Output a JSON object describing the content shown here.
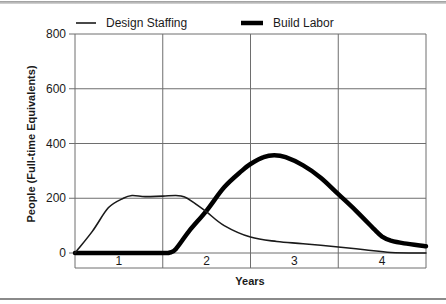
{
  "chart_data": {
    "type": "line",
    "title": "",
    "xlabel": "Years",
    "ylabel": "People (Full-time Equivalents)",
    "xlim": [
      0,
      4
    ],
    "ylim": [
      0,
      800
    ],
    "yticks": [
      0,
      200,
      400,
      600,
      800
    ],
    "ytick_labels": [
      "0",
      "200",
      "400",
      "600",
      "800"
    ],
    "x_band_labels": [
      "1",
      "2",
      "3",
      "4"
    ],
    "grid": true,
    "legend_position": "top",
    "series": [
      {
        "name": "Design Staffing",
        "style": "thin",
        "color": "#1a1a1a",
        "x": [
          0,
          0.2,
          0.38,
          0.55,
          0.65,
          0.8,
          1.0,
          1.15,
          1.25,
          1.35,
          1.5,
          1.7,
          2.0,
          2.3,
          2.6,
          3.0,
          3.3,
          3.6,
          4.0
        ],
        "y": [
          0,
          80,
          165,
          200,
          210,
          206,
          208,
          210,
          205,
          185,
          150,
          100,
          58,
          42,
          34,
          22,
          12,
          2,
          0
        ]
      },
      {
        "name": "Build Labor",
        "style": "thick",
        "color": "#000000",
        "x": [
          0,
          0.5,
          1.0,
          1.08,
          1.15,
          1.3,
          1.5,
          1.7,
          1.9,
          2.0,
          2.15,
          2.27,
          2.4,
          2.6,
          2.8,
          3.0,
          3.2,
          3.4,
          3.5,
          3.6,
          3.75,
          4.0
        ],
        "y": [
          0,
          0,
          0,
          2,
          15,
          80,
          155,
          240,
          300,
          325,
          350,
          357,
          350,
          320,
          275,
          215,
          155,
          90,
          60,
          45,
          35,
          25
        ]
      }
    ]
  },
  "legend": {
    "items": [
      {
        "label": "Design Staffing",
        "style": "thin"
      },
      {
        "label": "Build Labor",
        "style": "thick"
      }
    ]
  },
  "axes": {
    "ylabel": "People (Full-time Equivalents)",
    "xlabel": "Years"
  }
}
